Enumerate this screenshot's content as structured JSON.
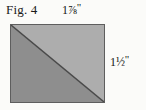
{
  "figure": {
    "caption": "Fig. 4",
    "shape": "square-patch-with-diagonal",
    "dimensions": {
      "top": {
        "whole": "1",
        "fraction": "⅞",
        "unit": "\"",
        "full_text": "1⅞\""
      },
      "right": {
        "whole": "1",
        "fraction": "½",
        "unit": "\"",
        "full_text": "1½\""
      }
    },
    "colors": {
      "background": "#fbfbf9",
      "lower_triangle": "#8e8e8e",
      "upper_triangle": "#adadad",
      "outline": "#5e5e5e",
      "diagonal_line": "#4a4a4a",
      "text": "#1a1a1a"
    }
  }
}
